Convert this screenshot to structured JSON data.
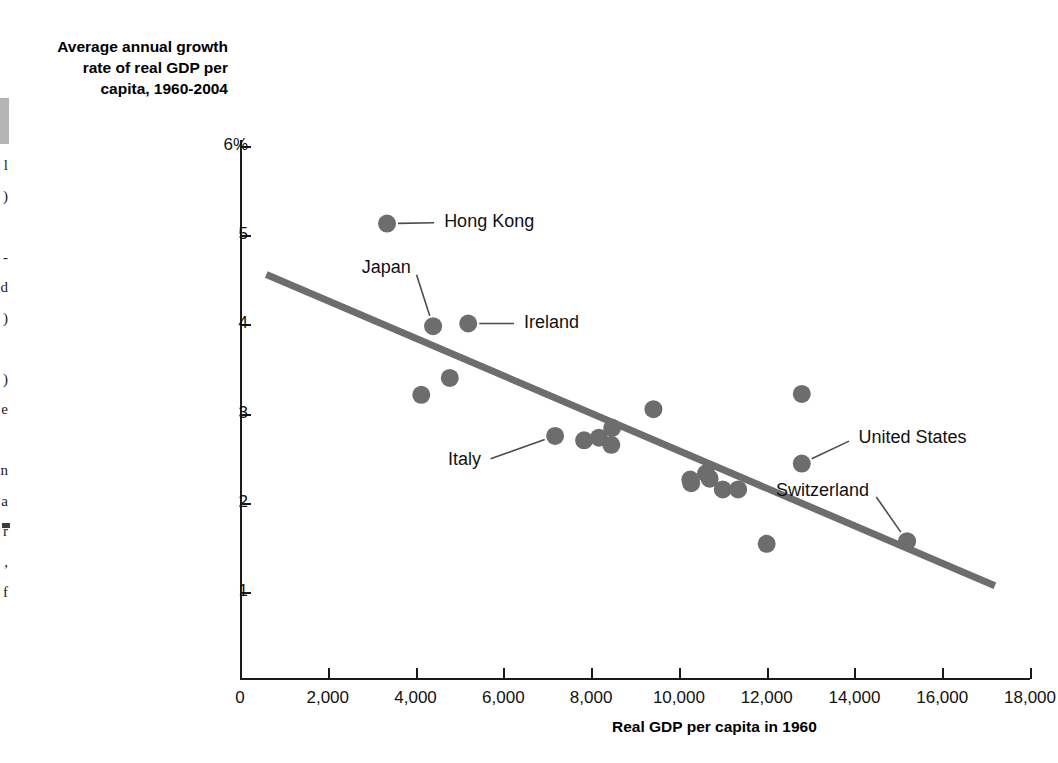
{
  "margin_note": {
    "fragment_lines": [
      "l",
      ")",
      "",
      "-",
      "d",
      ")",
      "",
      ")",
      "e",
      "",
      "n",
      "a",
      "r",
      ",",
      "f"
    ]
  },
  "chart_data": {
    "type": "scatter",
    "title": "",
    "ylabel": "Average annual growth\nrate of real GDP per\ncapita, 1960-2004",
    "xlabel": "Real GDP per capita in 1960",
    "xlim": [
      0,
      18000
    ],
    "ylim": [
      0,
      6
    ],
    "xticks": [
      0,
      2000,
      4000,
      6000,
      8000,
      10000,
      12000,
      14000,
      16000,
      18000
    ],
    "xtick_labels": [
      "0",
      "2,000",
      "4,000",
      "6,000",
      "8,000",
      "10,000",
      "12,000",
      "14,000",
      "16,000",
      "18,000"
    ],
    "yticks": [
      1,
      2,
      3,
      4,
      5,
      6
    ],
    "ytick_labels": [
      "1",
      "2",
      "3",
      "4",
      "5",
      "6%"
    ],
    "grid": false,
    "legend": null,
    "marker_color": "#6d6d6d",
    "trend_color": "#6d6d6d",
    "trendline": {
      "x0": 600,
      "y0": 4.56,
      "x1": 17200,
      "y1": 1.07
    },
    "points": [
      {
        "x": 3350,
        "y": 5.13,
        "label": "Hong Kong",
        "label_x": 4560,
        "label_y": 5.14,
        "leader": true
      },
      {
        "x": 4400,
        "y": 3.98,
        "label": "Japan",
        "label_x": 3980,
        "label_y": 4.62,
        "leader": true
      },
      {
        "x": 5200,
        "y": 4.01,
        "label": "Ireland",
        "label_x": 6380,
        "label_y": 4.01,
        "leader": true
      },
      {
        "x": 4780,
        "y": 3.4,
        "label": "",
        "leader": false
      },
      {
        "x": 4130,
        "y": 3.21,
        "label": "",
        "leader": false
      },
      {
        "x": 9420,
        "y": 3.05,
        "label": "",
        "leader": false
      },
      {
        "x": 12800,
        "y": 3.22,
        "label": "",
        "leader": false
      },
      {
        "x": 7180,
        "y": 2.75,
        "label": "Italy",
        "label_x": 5580,
        "label_y": 2.47,
        "leader": true
      },
      {
        "x": 7840,
        "y": 2.7,
        "label": "",
        "leader": false
      },
      {
        "x": 8180,
        "y": 2.73,
        "label": "",
        "leader": false
      },
      {
        "x": 8480,
        "y": 2.84,
        "label": "",
        "leader": false
      },
      {
        "x": 8460,
        "y": 2.65,
        "label": "",
        "leader": false
      },
      {
        "x": 10260,
        "y": 2.26,
        "label": "",
        "leader": false
      },
      {
        "x": 10280,
        "y": 2.22,
        "label": "",
        "leader": false
      },
      {
        "x": 10620,
        "y": 2.33,
        "label": "",
        "leader": false
      },
      {
        "x": 10700,
        "y": 2.27,
        "label": "",
        "leader": false
      },
      {
        "x": 11000,
        "y": 2.15,
        "label": "",
        "leader": false
      },
      {
        "x": 11350,
        "y": 2.15,
        "label": "",
        "leader": false
      },
      {
        "x": 12000,
        "y": 1.54,
        "label": "",
        "leader": false
      },
      {
        "x": 12800,
        "y": 2.44,
        "label": "United States",
        "label_x": 14000,
        "label_y": 2.72,
        "leader": true
      },
      {
        "x": 15200,
        "y": 1.57,
        "label": "Switzerland",
        "label_x": 14420,
        "label_y": 2.12,
        "leader": true
      }
    ]
  }
}
